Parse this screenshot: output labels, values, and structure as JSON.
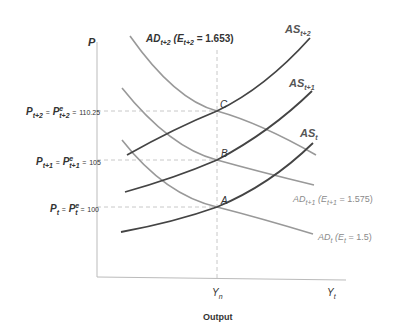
{
  "diagram": {
    "y_axis_label": "P",
    "x_axis_title": "Output",
    "x_ticks": [
      {
        "main": "Y",
        "sub": "n"
      },
      {
        "main": "Y",
        "sub": "t"
      }
    ],
    "price_levels": [
      {
        "lhs_main": "P",
        "lhs_sub": "t+2",
        "rhs_main": "P",
        "rhs_sup": "e",
        "rhs_sub": "t+2",
        "value": "110.25"
      },
      {
        "lhs_main": "P",
        "lhs_sub": "t+1",
        "rhs_main": "P",
        "rhs_sup": "e",
        "rhs_sub": "t+1",
        "value": "105"
      },
      {
        "lhs_main": "P",
        "lhs_sub": "t",
        "rhs_main": "P",
        "rhs_sup": "e",
        "rhs_sub": "t",
        "value": "100"
      }
    ],
    "equals": "=",
    "points": {
      "C": "C",
      "B": "B",
      "A": "A"
    },
    "as_curves": [
      {
        "main": "AS",
        "sub": "t+2"
      },
      {
        "main": "AS",
        "sub": "t+1"
      },
      {
        "main": "AS",
        "sub": "t"
      }
    ],
    "ad_curves": [
      {
        "main": "AD",
        "sub": "t+2",
        "paren_open": "(",
        "e_main": "E",
        "e_sub": "t+2",
        "eq": "=",
        "e_value": "1.653",
        "paren_close": ")"
      },
      {
        "main": "AD",
        "sub": "t+1",
        "paren_open": "(",
        "e_main": "E",
        "e_sub": "t+1",
        "eq": "=",
        "e_value": "1.575",
        "paren_close": ")"
      },
      {
        "main": "AD",
        "sub": "t",
        "paren_open": "(",
        "e_main": "E",
        "e_sub": "t",
        "eq": "=",
        "e_value": "1.5",
        "paren_close": ")"
      }
    ],
    "colors": {
      "as_curve": "#444444",
      "ad_curve": "#999999",
      "axis": "#bbbbbb",
      "dashed": "#c8c8c8"
    }
  }
}
